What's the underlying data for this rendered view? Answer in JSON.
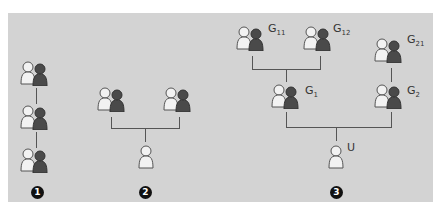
{
  "diagram": {
    "colors": {
      "background": "#d3d3d3",
      "line": "#555555",
      "light_person": "#f2f2f2",
      "dark_person": "#4a4a4a",
      "badge": "#111111"
    },
    "scenarios": [
      {
        "number": "1",
        "nodes": [
          {
            "type": "group"
          },
          {
            "type": "group"
          },
          {
            "type": "group"
          }
        ]
      },
      {
        "number": "2",
        "nodes": [
          {
            "type": "group"
          },
          {
            "type": "group"
          },
          {
            "type": "user"
          }
        ]
      },
      {
        "number": "3",
        "nodes": [
          {
            "type": "group",
            "label": "G",
            "sub": "11"
          },
          {
            "type": "group",
            "label": "G",
            "sub": "12"
          },
          {
            "type": "group",
            "label": "G",
            "sub": "21"
          },
          {
            "type": "group",
            "label": "G",
            "sub": "1"
          },
          {
            "type": "group",
            "label": "G",
            "sub": "2"
          },
          {
            "type": "user",
            "label": "U",
            "sub": ""
          }
        ]
      }
    ]
  }
}
